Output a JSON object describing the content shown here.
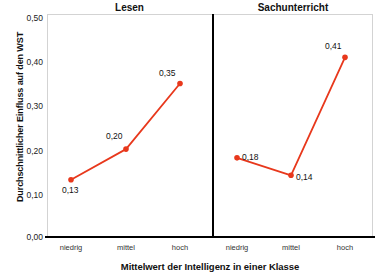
{
  "chart_data": {
    "type": "line",
    "title": "",
    "xlabel": "Mittelwert der Intelligenz in einer Klasse",
    "ylabel": "Durchschnittlicher Einfluss auf den WST",
    "ylim": [
      0.0,
      0.5
    ],
    "ytick_labels": [
      "0,50",
      "0,40",
      "0,30",
      "0,20",
      "0,10",
      "0,00"
    ],
    "ytick_values": [
      0.5,
      0.4,
      0.3,
      0.2,
      0.1,
      0.0
    ],
    "categories": [
      "niedrig",
      "mittel",
      "hoch"
    ],
    "grid": false,
    "legend": "none",
    "accent_color": "#E8381C",
    "panels": [
      {
        "title": "Lesen",
        "categories": [
          "niedrig",
          "mittel",
          "hoch"
        ],
        "values": [
          0.13,
          0.2,
          0.35
        ],
        "value_labels": [
          "0,13",
          "0,20",
          "0,35"
        ]
      },
      {
        "title": "Sachunterricht",
        "categories": [
          "niedrig",
          "mittel",
          "hoch"
        ],
        "values": [
          0.18,
          0.14,
          0.41
        ],
        "value_labels": [
          "0,18",
          "0,14",
          "0,41"
        ]
      }
    ]
  },
  "axis": {
    "y_title": "Durchschnittlicher Einfluss auf den WST",
    "x_title": "Mittelwert der Intelligenz in einer Klasse",
    "y_ticks": [
      {
        "label": "0,50"
      },
      {
        "label": "0,40"
      },
      {
        "label": "0,30"
      },
      {
        "label": "0,20"
      },
      {
        "label": "0,10"
      },
      {
        "label": "0,00"
      }
    ]
  },
  "panels": {
    "left": {
      "title": "Lesen",
      "cat0": "niedrig",
      "cat1": "mittel",
      "cat2": "hoch",
      "lbl0": "0,13",
      "lbl1": "0,20",
      "lbl2": "0,35"
    },
    "right": {
      "title": "Sachunterricht",
      "cat0": "niedrig",
      "cat1": "mittel",
      "cat2": "hoch",
      "lbl0": "0,18",
      "lbl1": "0,14",
      "lbl2": "0,41"
    }
  }
}
